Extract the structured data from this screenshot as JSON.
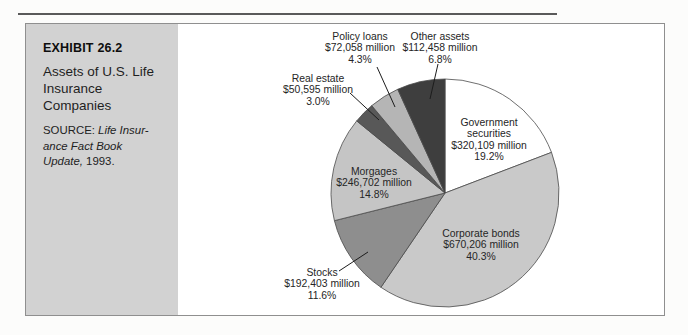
{
  "sidebar": {
    "exhibit_label": "EXHIBIT 26.2",
    "title_lines": [
      "Assets of U.S. Life",
      "Insurance",
      "Companies"
    ],
    "source": {
      "label": "SOURCE:",
      "italic_line1": "Life Insur-",
      "italic_line2": "ance Fact Book",
      "italic_line3": "Update,",
      "year": "1993."
    }
  },
  "chart_data": {
    "type": "pie",
    "title": "Assets of U.S. Life Insurance Companies",
    "unit": "$ million",
    "start_angle_deg": 0,
    "direction": "clockwise",
    "slices": [
      {
        "id": "government-securities",
        "label": "Government securities",
        "amount": "$320,109 million",
        "value_million": 320109,
        "pct": 19.2,
        "pct_label": "19.2%",
        "color": "#ffffff"
      },
      {
        "id": "corporate-bonds",
        "label": "Corporate bonds",
        "amount": "$670,206 million",
        "value_million": 670206,
        "pct": 40.3,
        "pct_label": "40.3%",
        "color": "#c9c9c9"
      },
      {
        "id": "stocks",
        "label": "Stocks",
        "amount": "$192,403 million",
        "value_million": 192403,
        "pct": 11.6,
        "pct_label": "11.6%",
        "color": "#8e8e8e"
      },
      {
        "id": "morgages",
        "label": "Morgages",
        "amount": "$246,702 million",
        "value_million": 246702,
        "pct": 14.8,
        "pct_label": "14.8%",
        "color": "#c5c5c5"
      },
      {
        "id": "real-estate",
        "label": "Real estate",
        "amount": "$50,595 million",
        "value_million": 50595,
        "pct": 3.0,
        "pct_label": "3.0%",
        "color": "#585858"
      },
      {
        "id": "policy-loans",
        "label": "Policy loans",
        "amount": "$72,058 million",
        "value_million": 72058,
        "pct": 4.3,
        "pct_label": "4.3%",
        "color": "#b5b5b5"
      },
      {
        "id": "other-assets",
        "label": "Other assets",
        "amount": "$112,458 million",
        "value_million": 112458,
        "pct": 6.8,
        "pct_label": "6.8%",
        "color": "#3e3e3e"
      }
    ],
    "outline_color": "#4a4a4a"
  }
}
